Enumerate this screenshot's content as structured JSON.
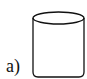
{
  "figure": {
    "label": "a)",
    "shape": "cylinder",
    "stroke_color": "#111111"
  }
}
